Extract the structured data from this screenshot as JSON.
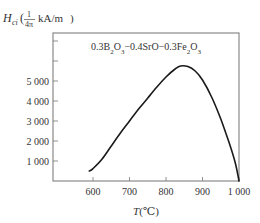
{
  "chart_data": {
    "type": "line",
    "title": "",
    "annotation": "0.3B2O3−0.4SrO−0.3Fe2O3",
    "ylabel": "Hci(1/4π kA/m)",
    "ylabel_parts": {
      "symbol": "H",
      "subscript": "ci",
      "frac_num": "1",
      "frac_den": "4π",
      "unit": "kA/m"
    },
    "xlabel": "T(℃)",
    "x_ticks": [
      600,
      700,
      800,
      900,
      1000
    ],
    "x_tick_labels": [
      "600",
      "700",
      "800",
      "900",
      "1 000"
    ],
    "y_ticks": [
      1000,
      2000,
      3000,
      4000,
      5000,
      6000,
      7000
    ],
    "y_tick_labels": [
      "1 000",
      "2 000",
      "3 000",
      "4 000",
      "5 000",
      "",
      ""
    ],
    "xlim": [
      490,
      1000
    ],
    "ylim": [
      0,
      7800
    ],
    "grid": false,
    "legend": "none",
    "series": [
      {
        "name": "0.3B2O3−0.4SrO−0.3Fe2O3",
        "x": [
          590,
          600,
          625,
          650,
          675,
          700,
          725,
          750,
          775,
          800,
          825,
          840,
          860,
          880,
          900,
          925,
          950,
          975,
          990,
          1000
        ],
        "values": [
          500,
          620,
          1100,
          1750,
          2400,
          3000,
          3600,
          4150,
          4700,
          5200,
          5600,
          5750,
          5720,
          5500,
          5050,
          4200,
          3100,
          1800,
          900,
          0
        ]
      }
    ]
  }
}
